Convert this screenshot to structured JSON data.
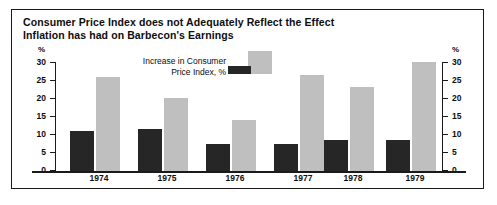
{
  "title": {
    "line1": "Consumer Price Index does not Adequately Reflect the Effect",
    "line2": "Inflation has had on Barbecon's Earnings"
  },
  "axis": {
    "unit_left": "%",
    "unit_right": "%",
    "ticks": [
      "30",
      "25",
      "20",
      "15",
      "10",
      "5",
      "0"
    ]
  },
  "legend": {
    "line1": "Increase in Consumer",
    "line2": "Price Index, %",
    "dark_swatch_color": "#262626",
    "light_swatch_color": "#bfbfbf"
  },
  "years": [
    "1974",
    "1975",
    "1976",
    "1977",
    "1978",
    "1979"
  ],
  "chart_data": {
    "type": "bar",
    "title": "Consumer Price Index does not Adequately Reflect the Effect Inflation has had on Barbecon's Earnings",
    "xlabel": "",
    "ylabel": "%",
    "ylim": [
      0,
      30
    ],
    "yticks": [
      0,
      5,
      10,
      15,
      20,
      25,
      30
    ],
    "grid": false,
    "legend_position": "top-center",
    "categories": [
      "1974",
      "1975",
      "1976",
      "1977",
      "1978",
      "1979"
    ],
    "series": [
      {
        "name": "Increase in Consumer Price Index, %",
        "color": "#262626",
        "values": [
          11,
          11.5,
          7.5,
          7.5,
          8.5,
          8.5
        ]
      },
      {
        "name": "Barbecon's Earnings increase, %",
        "color": "#bfbfbf",
        "values": [
          26,
          20,
          14,
          26.5,
          23,
          30
        ]
      }
    ]
  }
}
